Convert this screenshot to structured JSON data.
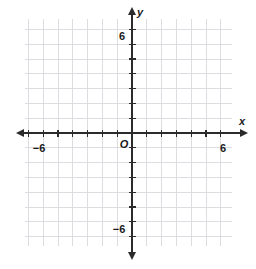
{
  "figure": {
    "kind": "coordinate-plane",
    "background_color": "#ffffff"
  },
  "chart_data": {
    "type": "scatter",
    "title": "",
    "subtitle": "",
    "xlabel": "x",
    "ylabel": "y",
    "xlim": [
      -7,
      7
    ],
    "ylim": [
      -8,
      7
    ],
    "grid": true,
    "grid_step": 1,
    "legend": null,
    "series": [
      {
        "name": "",
        "x": [],
        "y": []
      }
    ],
    "x_tick_labels": [
      "-6",
      "6"
    ],
    "x_tick_values": [
      -6,
      6
    ],
    "y_tick_labels": [
      "6",
      "-6"
    ],
    "y_tick_values": [
      6,
      -6
    ],
    "annotations": [
      "O"
    ],
    "axis_arrows": [
      "left",
      "right",
      "up",
      "down"
    ]
  },
  "labels": {
    "x_axis": "x",
    "y_axis": "y",
    "origin": "O",
    "x_neg_six": "−6",
    "x_pos_six": "6",
    "y_pos_six": "6",
    "y_neg_six": "−6"
  },
  "colors": {
    "grid_line": "#d8d8de",
    "axis_line": "#2b2b2b",
    "text": "#1a1a1a",
    "background": "#ffffff"
  },
  "geometry": {
    "grid_left": 25,
    "grid_top": 19,
    "grid_right": 232,
    "grid_bottom": 246,
    "cell_size": 14.8,
    "origin_x": 132,
    "origin_y": 133,
    "columns": 14,
    "rows": 15
  }
}
